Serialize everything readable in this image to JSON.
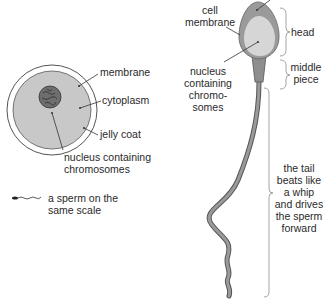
{
  "egg": {
    "labels": {
      "membrane": "membrane",
      "cytoplasm": "cytoplasm",
      "jelly_coat": "jelly coat",
      "nucleus_line1": "nucleus containing",
      "nucleus_line2": "chromosomes"
    },
    "scale_note": {
      "line1": "a sperm on the",
      "line2": "same scale"
    },
    "colors": {
      "jelly_coat_fill": "#ffffff",
      "cytoplasm_fill": "#c8c8c8",
      "nucleus_fill": "#6a6a6a",
      "outline": "#555555"
    }
  },
  "sperm": {
    "labels": {
      "cell_membrane_line1": "cell",
      "cell_membrane_line2": "membrane",
      "nucleus_line1": "nucleus",
      "nucleus_line2": "containing",
      "nucleus_line3": "chromo-",
      "nucleus_line4": "somes"
    },
    "regions": {
      "head": "head",
      "middle_piece_line1": "middle",
      "middle_piece_line2": "piece",
      "tail_line1": "the tail",
      "tail_line2": "beats like",
      "tail_line3": "a whip",
      "tail_line4": "and drives",
      "tail_line5": "the sperm",
      "tail_line6": "forward"
    },
    "colors": {
      "head_fill": "#9a9a9a",
      "nucleus_fill": "#d4d4d4",
      "tail_fill": "#8a8a8a",
      "brace": "#9a9a9a"
    }
  }
}
